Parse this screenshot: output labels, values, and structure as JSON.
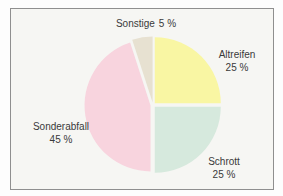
{
  "page": {
    "background": "#fdfdfd"
  },
  "frame": {
    "background": "#f6f6f3",
    "border_color": "#8f8f8f"
  },
  "chart_data": {
    "type": "pie",
    "title": "",
    "value_unit": "%",
    "categories": [
      "Altreifen",
      "Schrott",
      "Sonderabfall",
      "Sonstige"
    ],
    "values": [
      25,
      25,
      45,
      5
    ],
    "slices": [
      {
        "name": "Altreifen",
        "value": 25,
        "value_label": "25 %",
        "color": "#f9f6a3"
      },
      {
        "name": "Schrott",
        "value": 25,
        "value_label": "25 %",
        "color": "#d6e9dd"
      },
      {
        "name": "Sonderabfall",
        "value": 45,
        "value_label": "45 %",
        "color": "#f8d4de"
      },
      {
        "name": "Sonstige",
        "value": 5,
        "value_label": "5 %",
        "color": "#e7e1d1"
      }
    ],
    "start_angle_deg": 0,
    "direction": "clockwise",
    "explode_px": 2.5,
    "geometry": {
      "cx": 153,
      "cy": 105,
      "r": 66
    },
    "labels_position": "outside",
    "text_color": "#3a3a3a",
    "legend": "none",
    "grid": false
  }
}
